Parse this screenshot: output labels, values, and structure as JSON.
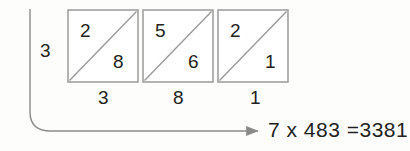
{
  "diagram": {
    "type": "lattice-multiplication",
    "multiplier_label": "3",
    "cells": [
      {
        "upper": "2",
        "lower": "8",
        "bottom_label": "3"
      },
      {
        "upper": "5",
        "lower": "6",
        "bottom_label": "8"
      },
      {
        "upper": "2",
        "lower": "1",
        "bottom_label": "1"
      }
    ],
    "bottom_labels": [
      "3",
      "8",
      "1"
    ],
    "equation": {
      "left_factor": "7",
      "operator": "x",
      "right_factor": "483",
      "equals": "=",
      "product": "3381",
      "full_text": "7 x 483 =3381"
    },
    "colors": {
      "ink": "#231f20",
      "line": "#8a8a8a",
      "box_border": "#9a9a9a",
      "background": "#fdfdfc"
    },
    "annotations": {
      "flow_arrow": "curved-arrow-left-to-right",
      "diagonal_direction": "bottom-left-to-top-right"
    }
  }
}
